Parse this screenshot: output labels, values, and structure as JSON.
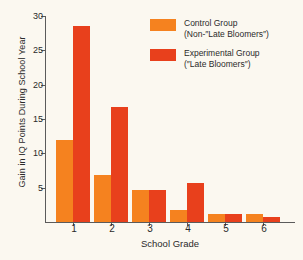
{
  "chart_data": {
    "type": "bar",
    "title": "",
    "xlabel": "School Grade",
    "ylabel": "Gain in IQ Points During School Year",
    "categories": [
      "1",
      "2",
      "3",
      "4",
      "5",
      "6"
    ],
    "ylim": [
      0,
      30
    ],
    "yticks": [
      5,
      10,
      15,
      20,
      25,
      30
    ],
    "grid": false,
    "legend_position": "top-right",
    "series": [
      {
        "name": "Control Group (Non-″Late Bloomers″)",
        "color": "#F5821F",
        "values": [
          11.9,
          6.9,
          4.6,
          1.8,
          1.1,
          1.1
        ]
      },
      {
        "name": "Experimental Group (″Late Bloomers″)",
        "color": "#E8401C",
        "values": [
          28.6,
          16.8,
          4.6,
          5.7,
          1.1,
          0.7
        ]
      }
    ]
  },
  "legend": {
    "entries": [
      {
        "line1": "Control Group",
        "line2": "(Non-″Late Bloomers″)",
        "swatch": "control"
      },
      {
        "line1": "Experimental Group",
        "line2": "(″Late Bloomers″)",
        "swatch": "exp"
      }
    ]
  },
  "axes": {
    "y_title": "Gain in IQ Points During School Year",
    "x_title": "School Grade",
    "y_tick_labels": [
      "5",
      "10",
      "15",
      "20",
      "25",
      "30"
    ],
    "x_tick_labels": [
      "1",
      "2",
      "3",
      "4",
      "5",
      "6"
    ]
  },
  "colors": {
    "control": "#F5821F",
    "experimental": "#E8401C",
    "background": "#fbf8f0",
    "axis": "#5b5b5b"
  }
}
